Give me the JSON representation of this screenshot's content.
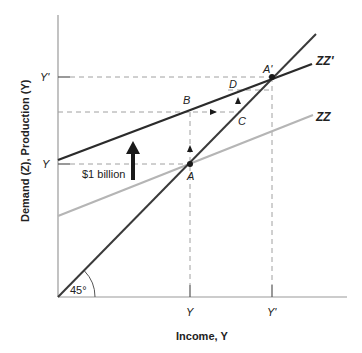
{
  "diagram": {
    "type": "keynesian-cross-multiplier",
    "y_axis_label": "Demand (Z), Production (Y)",
    "x_axis_label": "Income, Y",
    "y_ticks": {
      "upper": "Y'",
      "lower": "Y"
    },
    "x_ticks": {
      "left": "Y",
      "right": "Y'"
    },
    "lines": {
      "zz_new": "ZZ'",
      "zz_old": "ZZ"
    },
    "points": {
      "A": "A",
      "A_prime": "A'",
      "B": "B",
      "C": "C",
      "D": "D"
    },
    "shift_label": "$1 billion",
    "angle_label": "45°",
    "colors": {
      "zz_new": "#2b2b2b",
      "zz_old": "#b5b5b5",
      "line_45": "#3a3a3a",
      "axes": "#9a9a9a",
      "dashed": "#a0a0a0"
    }
  }
}
